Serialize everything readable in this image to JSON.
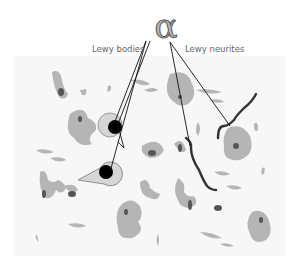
{
  "diagram": {
    "symbol": "α",
    "labels": {
      "lewy_bodies": "Lewy bodies",
      "lewy_neurites": "Lewy neurites"
    },
    "colors": {
      "background": "#ffffff",
      "tissue": "#f7f7f7",
      "cell_body": "#b5b5b5",
      "nucleus": "#555555",
      "lewy_body_core": "#000000",
      "lewy_body_halo": "#d8d8d8",
      "neurite": "#333333",
      "pointer_line": "#111111"
    }
  }
}
